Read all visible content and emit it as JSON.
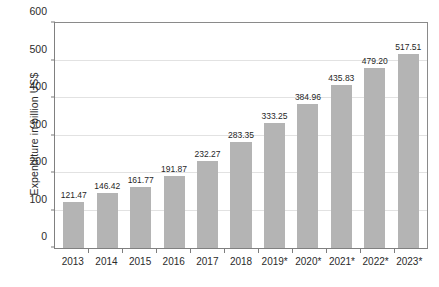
{
  "chart_data": {
    "type": "bar",
    "title": "",
    "subtitle": "",
    "xlabel": "",
    "ylabel": "Expenditure in billion US$",
    "categories": [
      "2013",
      "2014",
      "2015",
      "2016",
      "2017",
      "2018",
      "2019*",
      "2020*",
      "2021*",
      "2022*",
      "2023*"
    ],
    "values": [
      121.47,
      146.42,
      161.77,
      191.87,
      232.27,
      283.35,
      333.25,
      384.96,
      435.83,
      479.2,
      517.51
    ],
    "value_labels": [
      "121.47",
      "146.42",
      "161.77",
      "191.87",
      "232.27",
      "283.35",
      "333.25",
      "384.96",
      "435.83",
      "479.20",
      "517.51"
    ],
    "ylim": [
      0,
      600
    ],
    "ytick_values": [
      0,
      100,
      200,
      300,
      400,
      500,
      600
    ],
    "ytick_labels": [
      "0",
      "100",
      "200",
      "300",
      "400",
      "500",
      "600"
    ],
    "grid": true,
    "legend": "none",
    "series_color": "#b4b4b4",
    "grid_color": "#e2e2e2",
    "axis_color": "#808080",
    "text_color": "#2b2b2b"
  }
}
